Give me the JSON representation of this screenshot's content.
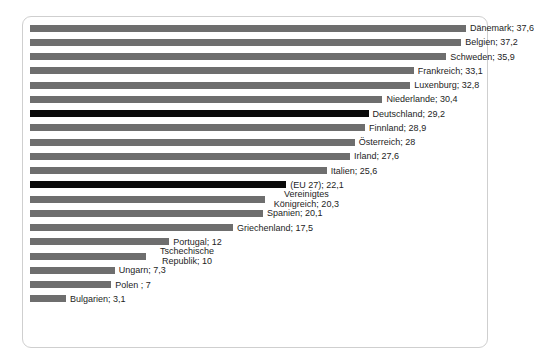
{
  "chart": {
    "type": "bar",
    "orientation": "horizontal",
    "title": "",
    "xlabel": "",
    "ylabel": "",
    "grid": false,
    "legend": false,
    "axis_visible": false,
    "colors": {
      "bar": "#6e6e6e",
      "bar_highlight": "#0a0a0a",
      "frame": "#cfcfcf",
      "background": "#ffffff",
      "label_text": "#1d1d1d"
    }
  },
  "chart_data": {
    "type": "bar",
    "orientation": "horizontal",
    "title": "",
    "xlabel": "",
    "ylabel": "",
    "xlim": [
      0,
      37.6
    ],
    "grid": false,
    "legend": false,
    "categories": [
      "Dänemark",
      "Belgien",
      "Schweden",
      "Frankreich",
      "Luxenburg",
      "Niederlande",
      "Deutschland",
      "Finnland",
      "Österreich",
      "Irland",
      "Italien",
      "(EU 27)",
      "Vereinigtes Königreich",
      "Spanien",
      "Griechenland",
      "Portugal",
      "Tschechische Republik",
      "Ungarn",
      "Polen ",
      "Bulgarien"
    ],
    "values": [
      37.6,
      37.2,
      35.9,
      33.1,
      32.8,
      30.4,
      29.2,
      28.9,
      28,
      27.6,
      25.6,
      22.1,
      20.3,
      20.1,
      17.5,
      12,
      10,
      7.3,
      7,
      3.1
    ],
    "value_labels": [
      "37,6",
      "37,2",
      "35,9",
      "33,1",
      "32,8",
      "30,4",
      "29,2",
      "28,9",
      "28",
      "27,6",
      "25,6",
      "22,1",
      "20,3",
      "20,1",
      "17,5",
      "12",
      "10",
      "7,3",
      "7",
      "3,1"
    ],
    "highlighted": [
      "Deutschland",
      "(EU 27)"
    ]
  },
  "bars": [
    {
      "name": "Dänemark",
      "value": 37.6,
      "label": "Dänemark; 37,6",
      "highlight": false,
      "wrap": false
    },
    {
      "name": "Belgien",
      "value": 37.2,
      "label": "Belgien; 37,2",
      "highlight": false,
      "wrap": false
    },
    {
      "name": "Schweden",
      "value": 35.9,
      "label": "Schweden; 35,9",
      "highlight": false,
      "wrap": false
    },
    {
      "name": "Frankreich",
      "value": 33.1,
      "label": "Frankreich; 33,1",
      "highlight": false,
      "wrap": false
    },
    {
      "name": "Luxenburg",
      "value": 32.8,
      "label": "Luxenburg; 32,8",
      "highlight": false,
      "wrap": false
    },
    {
      "name": "Niederlande",
      "value": 30.4,
      "label": "Niederlande; 30,4",
      "highlight": false,
      "wrap": false
    },
    {
      "name": "Deutschland",
      "value": 29.2,
      "label": "Deutschland; 29,2",
      "highlight": true,
      "wrap": false
    },
    {
      "name": "Finnland",
      "value": 28.9,
      "label": "Finnland; 28,9",
      "highlight": false,
      "wrap": false
    },
    {
      "name": "Österreich",
      "value": 28,
      "label": "Österreich; 28",
      "highlight": false,
      "wrap": false
    },
    {
      "name": "Irland",
      "value": 27.6,
      "label": "Irland; 27,6",
      "highlight": false,
      "wrap": false
    },
    {
      "name": "Italien",
      "value": 25.6,
      "label": "Italien; 25,6",
      "highlight": false,
      "wrap": false
    },
    {
      "name": "(EU 27)",
      "value": 22.1,
      "label": "(EU 27); 22,1",
      "highlight": true,
      "wrap": false
    },
    {
      "name": "Vereinigtes Königreich",
      "value": 20.3,
      "label": "Vereinigtes Königreich; 20,3",
      "highlight": false,
      "wrap": true
    },
    {
      "name": "Spanien",
      "value": 20.1,
      "label": "Spanien; 20,1",
      "highlight": false,
      "wrap": false
    },
    {
      "name": "Griechenland",
      "value": 17.5,
      "label": "Griechenland; 17,5",
      "highlight": false,
      "wrap": false
    },
    {
      "name": "Portugal",
      "value": 12,
      "label": "Portugal; 12",
      "highlight": false,
      "wrap": false
    },
    {
      "name": "Tschechische Republik",
      "value": 10,
      "label": "Tschechische Republik; 10",
      "highlight": false,
      "wrap": true
    },
    {
      "name": "Ungarn",
      "value": 7.3,
      "label": "Ungarn; 7,3",
      "highlight": false,
      "wrap": false
    },
    {
      "name": "Polen",
      "value": 7,
      "label": "Polen ; 7",
      "highlight": false,
      "wrap": false
    },
    {
      "name": "Bulgarien",
      "value": 3.1,
      "label": "Bulgarien; 3,1",
      "highlight": false,
      "wrap": false
    }
  ]
}
